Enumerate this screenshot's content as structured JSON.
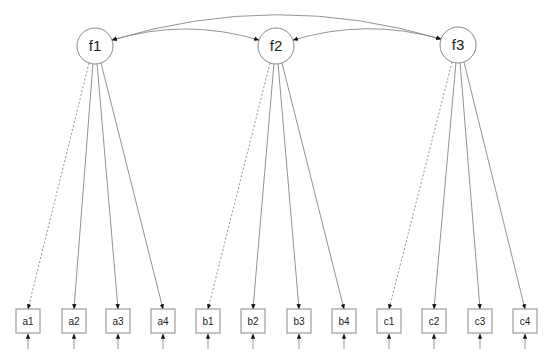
{
  "diagram": {
    "type": "structural-equation-model",
    "colors": {
      "stroke": "#888888",
      "arrow": "#111111",
      "text": "#222222",
      "background": "#ffffff"
    },
    "latent": [
      {
        "id": "f1",
        "label": "f1",
        "cx": 95,
        "cy": 46,
        "r": 18
      },
      {
        "id": "f2",
        "label": "f2",
        "cx": 276,
        "cy": 46,
        "r": 18
      },
      {
        "id": "f3",
        "label": "f3",
        "cx": 458,
        "cy": 45,
        "r": 18
      }
    ],
    "observed": [
      {
        "id": "a1",
        "label": "a1",
        "factor": "f1",
        "x": 16,
        "fixed": true
      },
      {
        "id": "a2",
        "label": "a2",
        "factor": "f1",
        "x": 62,
        "fixed": false
      },
      {
        "id": "a3",
        "label": "a3",
        "factor": "f1",
        "x": 106,
        "fixed": false
      },
      {
        "id": "a4",
        "label": "a4",
        "factor": "f1",
        "x": 151,
        "fixed": false
      },
      {
        "id": "b1",
        "label": "b1",
        "factor": "f2",
        "x": 196,
        "fixed": true
      },
      {
        "id": "b2",
        "label": "b2",
        "factor": "f2",
        "x": 241,
        "fixed": false
      },
      {
        "id": "b3",
        "label": "b3",
        "factor": "f2",
        "x": 287,
        "fixed": false
      },
      {
        "id": "b4",
        "label": "b4",
        "factor": "f2",
        "x": 332,
        "fixed": false
      },
      {
        "id": "c1",
        "label": "c1",
        "factor": "f3",
        "x": 377,
        "fixed": true
      },
      {
        "id": "c2",
        "label": "c2",
        "factor": "f3",
        "x": 422,
        "fixed": false
      },
      {
        "id": "c3",
        "label": "c3",
        "factor": "f3",
        "x": 468,
        "fixed": false
      },
      {
        "id": "c4",
        "label": "c4",
        "factor": "f3",
        "x": 513,
        "fixed": false
      }
    ],
    "box": {
      "y": 309,
      "size": 24
    },
    "covariances": [
      {
        "from": "f1",
        "to": "f2"
      },
      {
        "from": "f2",
        "to": "f3"
      },
      {
        "from": "f1",
        "to": "f3"
      }
    ],
    "legend_note": "dashed loadings = fixed first indicator"
  }
}
